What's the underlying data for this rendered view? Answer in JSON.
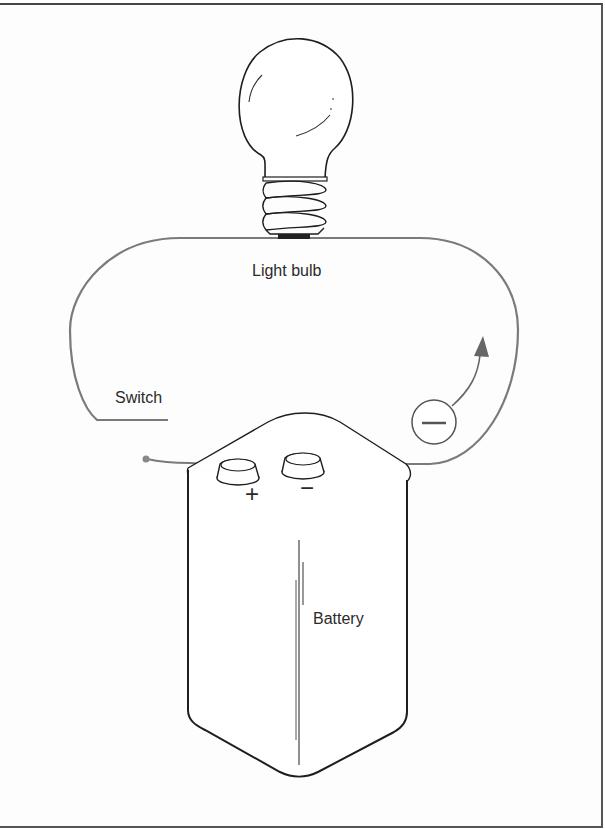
{
  "diagram": {
    "type": "simple electric circuit",
    "labels": {
      "light_bulb": "Light bulb",
      "switch": "Switch",
      "battery": "Battery",
      "positive_terminal": "+",
      "negative_terminal": "−",
      "electron_symbol": "−"
    },
    "colors": {
      "wire": "#7a7a7a",
      "outline": "#1e1e1e",
      "arrow": "#666666",
      "background": "#fdfdfd"
    }
  }
}
